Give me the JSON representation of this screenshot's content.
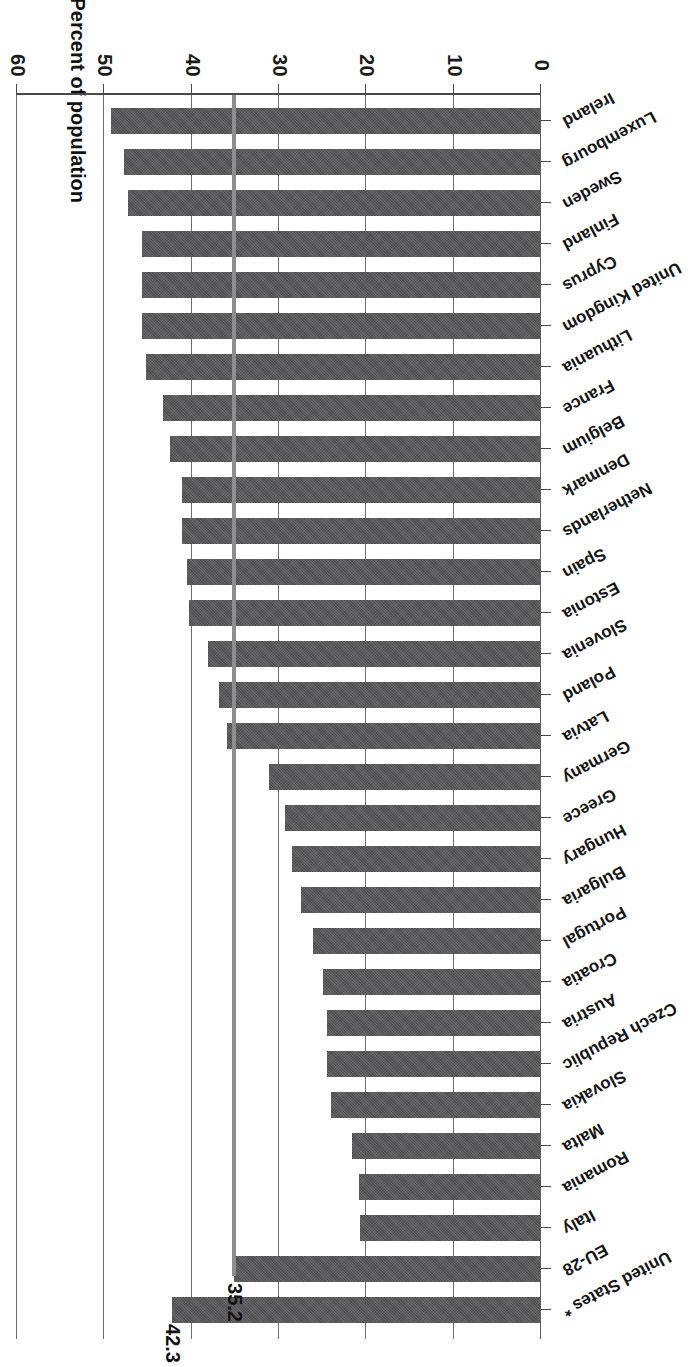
{
  "chart_data": {
    "type": "bar",
    "orientation": "horizontal-printed-upside-down",
    "title": "",
    "xlabel": "",
    "ylabel": "Percent of population",
    "axis_title": "Percent of population",
    "ylim": [
      0,
      60
    ],
    "tick_values": [
      0,
      10,
      20,
      30,
      40,
      50,
      60
    ],
    "tick_labels": [
      "0",
      "10",
      "20",
      "30",
      "40",
      "50",
      "60"
    ],
    "grid": true,
    "legend": "none",
    "bar_color": "#57575a",
    "reference_line_color": "#8e8e90",
    "axis_color": "#4a4a4c",
    "reference_line": {
      "value": 35.2,
      "label": "35.2",
      "series": "EU-28"
    },
    "annotations": [
      {
        "label": "42.3",
        "category": "United States *"
      },
      {
        "label": "35.2",
        "category": "EU-28"
      }
    ],
    "footnote_marker": "*",
    "categories": [
      "Ireland",
      "Luxembourg",
      "Sweden",
      "Finland",
      "Cyprus",
      "United Kingdom",
      "Lithuania",
      "France",
      "Belgium",
      "Denmark",
      "Netherlands",
      "Spain",
      "Estonia",
      "Slovenia",
      "Poland",
      "Latvia",
      "Germany",
      "Greece",
      "Hungary",
      "Bulgaria",
      "Portugal",
      "Croatia",
      "Austria",
      "Czech Republic",
      "Slovakia",
      "Malta",
      "Romania",
      "Italy",
      "EU-28",
      "United States *"
    ],
    "values": [
      49.3,
      47.8,
      47.3,
      45.7,
      45.7,
      45.7,
      45.3,
      43.3,
      42.5,
      41.1,
      41.1,
      40.5,
      40.3,
      38.1,
      36.9,
      36.0,
      31.1,
      29.3,
      28.5,
      27.5,
      26.1,
      25.0,
      24.5,
      24.5,
      24.1,
      21.6,
      20.9,
      20.7,
      35.2,
      42.3
    ],
    "bold_categories": [
      "EU-28",
      "United States *"
    ],
    "data_labels": {
      "EU-28": "35.2",
      "United States *": "42.3"
    }
  },
  "axis": {
    "title": "Percent of population",
    "ticks": [
      "0",
      "10",
      "20",
      "30",
      "40",
      "50",
      "60"
    ]
  },
  "labels": {
    "ireland": "Ireland",
    "luxembourg": "Luxembourg",
    "sweden": "Sweden",
    "finland": "Finland",
    "cyprus": "Cyprus",
    "united_kingdom": "United Kingdom",
    "lithuania": "Lithuania",
    "france": "France",
    "belgium": "Belgium",
    "denmark": "Denmark",
    "netherlands": "Netherlands",
    "spain": "Spain",
    "estonia": "Estonia",
    "slovenia": "Slovenia",
    "poland": "Poland",
    "latvia": "Latvia",
    "germany": "Germany",
    "greece": "Greece",
    "hungary": "Hungary",
    "bulgaria": "Bulgaria",
    "portugal": "Portugal",
    "croatia": "Croatia",
    "austria": "Austria",
    "czech_republic": "Czech Republic",
    "slovakia": "Slovakia",
    "malta": "Malta",
    "romania": "Romania",
    "italy": "Italy",
    "eu28": "EU-28",
    "united_states": "United States *"
  },
  "value_labels": {
    "us": "42.3",
    "eu": "35.2"
  }
}
